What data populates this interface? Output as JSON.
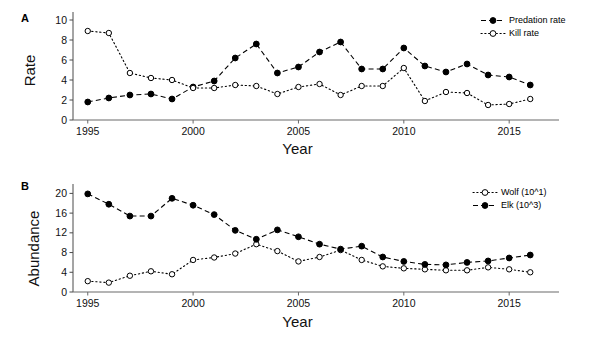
{
  "figure": {
    "panelA_letter": "A",
    "panelB_letter": "B"
  },
  "panelA": {
    "ylabel": "Rate",
    "xlabel": "Year",
    "legend": [
      {
        "label": "Predation rate",
        "marker": "filled-circle",
        "line": "dashed"
      },
      {
        "label": "Kill rate",
        "marker": "open-circle",
        "line": "dotted"
      }
    ]
  },
  "panelB": {
    "ylabel": "Abundance",
    "xlabel": "Year",
    "legend": [
      {
        "label": "Wolf (10^1)",
        "marker": "open-circle",
        "line": "dotted"
      },
      {
        "label": "Elk (10^3)",
        "marker": "filled-circle",
        "line": "dashed"
      }
    ]
  },
  "chart_data": [
    {
      "type": "line",
      "panel": "A",
      "title": "",
      "xlabel": "Year",
      "ylabel": "Rate",
      "xlim": [
        1994.3,
        2016.7
      ],
      "ylim": [
        0,
        10.6
      ],
      "xticks": [
        1995,
        2000,
        2005,
        2010,
        2015
      ],
      "yticks": [
        0,
        2,
        4,
        6,
        8,
        10
      ],
      "grid": false,
      "legend_position": "top-right",
      "x": [
        1995,
        1996,
        1997,
        1998,
        1999,
        2000,
        2001,
        2002,
        2003,
        2004,
        2005,
        2006,
        2007,
        2008,
        2009,
        2010,
        2011,
        2012,
        2013,
        2014,
        2015,
        2016
      ],
      "series": [
        {
          "name": "Predation rate",
          "marker": "filled-circle",
          "line": "dashed",
          "color": "#000000",
          "values": [
            1.8,
            2.2,
            2.5,
            2.6,
            2.1,
            3.3,
            3.9,
            6.2,
            7.6,
            4.7,
            5.3,
            6.8,
            7.8,
            5.1,
            5.1,
            7.2,
            5.4,
            4.8,
            5.6,
            4.5,
            4.3,
            3.5
          ]
        },
        {
          "name": "Kill rate",
          "marker": "open-circle",
          "line": "dotted",
          "color": "#000000",
          "values": [
            8.9,
            8.7,
            4.7,
            4.2,
            4.0,
            3.2,
            3.2,
            3.5,
            3.4,
            2.6,
            3.3,
            3.6,
            2.5,
            3.4,
            3.4,
            5.2,
            1.9,
            2.8,
            2.7,
            1.5,
            1.6,
            2.1
          ]
        }
      ]
    },
    {
      "type": "line",
      "panel": "B",
      "title": "",
      "xlabel": "Year",
      "ylabel": "Abundance",
      "xlim": [
        1994.3,
        2016.7
      ],
      "ylim": [
        0,
        21.5
      ],
      "xticks": [
        1995,
        2000,
        2005,
        2010,
        2015
      ],
      "yticks": [
        0,
        4,
        8,
        12,
        16,
        20
      ],
      "grid": false,
      "legend_position": "top-right",
      "x": [
        1995,
        1996,
        1997,
        1998,
        1999,
        2000,
        2001,
        2002,
        2003,
        2004,
        2005,
        2006,
        2007,
        2008,
        2009,
        2010,
        2011,
        2012,
        2013,
        2014,
        2015,
        2016
      ],
      "series": [
        {
          "name": "Wolf (10^1)",
          "marker": "open-circle",
          "line": "dotted",
          "color": "#000000",
          "values": [
            2.2,
            1.9,
            3.3,
            4.2,
            3.6,
            6.5,
            7.0,
            7.8,
            9.7,
            8.3,
            6.2,
            7.1,
            8.5,
            6.5,
            5.2,
            4.8,
            4.6,
            4.4,
            4.4,
            5.0,
            4.6,
            4.0
          ]
        },
        {
          "name": "Elk (10^3)",
          "marker": "filled-circle",
          "line": "dashed",
          "color": "#000000",
          "values": [
            19.9,
            17.8,
            15.4,
            15.4,
            19.0,
            17.6,
            15.7,
            12.5,
            10.7,
            12.6,
            11.2,
            9.7,
            8.7,
            9.3,
            7.1,
            6.2,
            5.6,
            5.5,
            6.0,
            6.3,
            6.9,
            7.5
          ]
        }
      ]
    }
  ]
}
